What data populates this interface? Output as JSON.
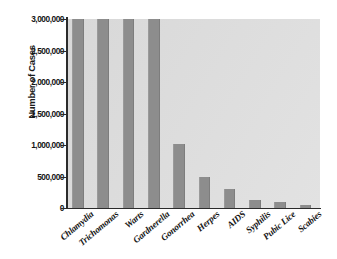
{
  "chart_data": {
    "type": "bar",
    "title": "",
    "xlabel": "",
    "ylabel": "Number of Cases",
    "categories": [
      "Chlamydia",
      "Trichomonas",
      "Warts",
      "Gardnerella",
      "Gonorrhea",
      "Herpes",
      "AIDS",
      "Syphilis",
      "Pubic Lice",
      "Scabies"
    ],
    "values": [
      3000000,
      3000000,
      3000000,
      3000000,
      1020000,
      500000,
      300000,
      125000,
      90000,
      40000
    ],
    "values_clipped_at_max": [
      true,
      true,
      true,
      true,
      false,
      false,
      false,
      false,
      false,
      false
    ],
    "ylim": [
      0,
      3000000
    ],
    "ytick_values": [
      0,
      500000,
      1000000,
      1500000,
      2000000,
      2500000,
      3000000
    ],
    "ytick_labels": [
      "0",
      "500,000",
      "1,000,000",
      "1,500,000",
      "2,000,000",
      "2,500,000",
      "3,000,000"
    ],
    "grid": false,
    "legend": null,
    "series": [
      {
        "name": "Number of Cases",
        "values": [
          3000000,
          3000000,
          3000000,
          3000000,
          1020000,
          500000,
          300000,
          125000,
          90000,
          40000
        ]
      }
    ],
    "colors": {
      "bar": "#8d8d8d",
      "plot_background": "#dcdcdc",
      "page_background": "#ffffff",
      "axis": "#2b2b2b",
      "text": "#161616"
    }
  }
}
